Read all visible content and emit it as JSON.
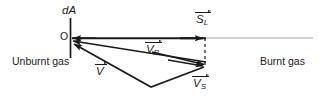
{
  "figure": {
    "colors": {
      "stroke": "#1a1a1a",
      "thin_line": "#8a8a8a",
      "background": "#ffffff"
    },
    "labels": {
      "area_element": "dA",
      "origin": "O",
      "region_left": "Unburnt gas",
      "region_right": "Burnt gas"
    },
    "vectors": [
      {
        "id": "SL",
        "symbol": "S",
        "subscript": "L",
        "name": "laminar-burning-velocity-vector",
        "description": "horizontal vector pointing left toward O along the normal of dA"
      },
      {
        "id": "VP",
        "symbol": "V",
        "subscript": "P",
        "name": "propagation-velocity-vector",
        "description": "vector pointing left-up toward O from the flame point"
      },
      {
        "id": "V",
        "symbol": "V",
        "subscript": "",
        "name": "gas-velocity-vector",
        "description": "vector pointing up-left toward O via lower vertex"
      },
      {
        "id": "VS",
        "symbol": "V",
        "subscript": "S",
        "name": "flame-surface-velocity-vector",
        "description": "vector pointing right toward the flame point"
      }
    ],
    "geometry": {
      "origin": {
        "x": 70,
        "y": 38
      },
      "flame_point": {
        "x": 206,
        "y": 65
      },
      "lower_vertex": {
        "x": 151,
        "y": 87
      },
      "plane_line": {
        "x": 70,
        "y1": 18,
        "y2": 58
      },
      "axis_line": {
        "y": 38,
        "x1": 70,
        "x2": 313
      },
      "dashed_drop": {
        "x": 205,
        "y1": 38,
        "y2": 65
      },
      "sl_arrow_tip": {
        "x": 200,
        "y": 38
      }
    }
  }
}
